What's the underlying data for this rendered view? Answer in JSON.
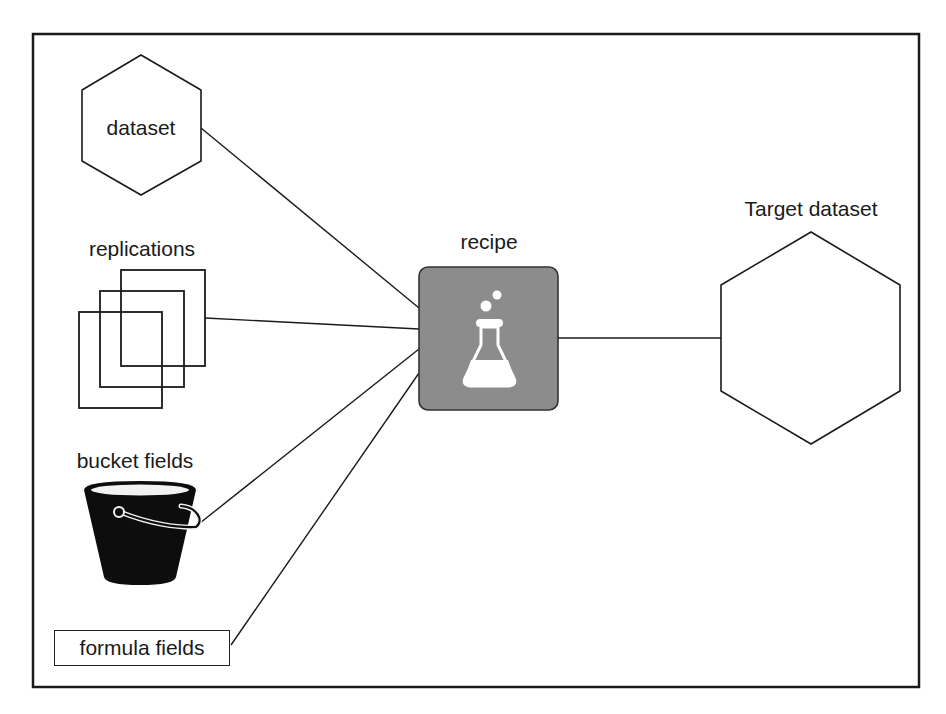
{
  "diagram": {
    "title": "",
    "nodes": {
      "dataset": {
        "label": "dataset",
        "shape": "hexagon"
      },
      "replications": {
        "label": "replications",
        "shape": "stacked-squares"
      },
      "bucket_fields": {
        "label": "bucket fields",
        "shape": "bucket-icon"
      },
      "formula_fields": {
        "label": "formula fields",
        "shape": "rectangle"
      },
      "recipe": {
        "label": "recipe",
        "shape": "rounded-square",
        "icon": "flask-icon"
      },
      "target_dataset": {
        "label": "Target dataset",
        "shape": "hexagon"
      }
    },
    "edges": [
      {
        "from": "dataset",
        "to": "recipe"
      },
      {
        "from": "replications",
        "to": "recipe"
      },
      {
        "from": "bucket_fields",
        "to": "recipe"
      },
      {
        "from": "formula_fields",
        "to": "recipe"
      },
      {
        "from": "recipe",
        "to": "target_dataset"
      }
    ],
    "colors": {
      "stroke": "#1a1a1a",
      "recipe_fill": "#8c8c8c",
      "icon_fill": "#ffffff",
      "bucket_fill": "#0d0d0d"
    }
  }
}
